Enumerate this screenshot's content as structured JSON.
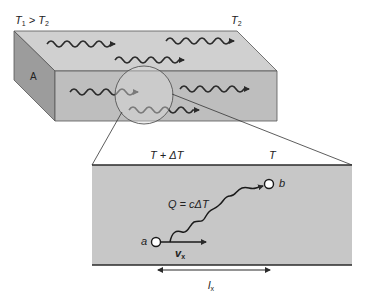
{
  "diagram": {
    "top_left_label": {
      "T": "T",
      "sub1": "1",
      "op": " > ",
      "T2": "T",
      "sub2": "2"
    },
    "top_right_label": {
      "T": "T",
      "sub": "2"
    },
    "face_label": "A",
    "zoom_panel": {
      "left_temp_label": "T + ΔT",
      "right_temp_label": "T",
      "energy_label": "Q = cΔT",
      "point_a_label": "a",
      "point_b_label": "b",
      "velocity_label": {
        "v": "v",
        "sub": "x"
      },
      "distance_label": {
        "l": "l",
        "sub": "x"
      }
    },
    "colors": {
      "top_face": "#d0d0d0",
      "front_face": "#bebebe",
      "left_face": "#9c9c9c",
      "panel": "#c7c7c7",
      "lines": "#2a2a2a"
    }
  }
}
